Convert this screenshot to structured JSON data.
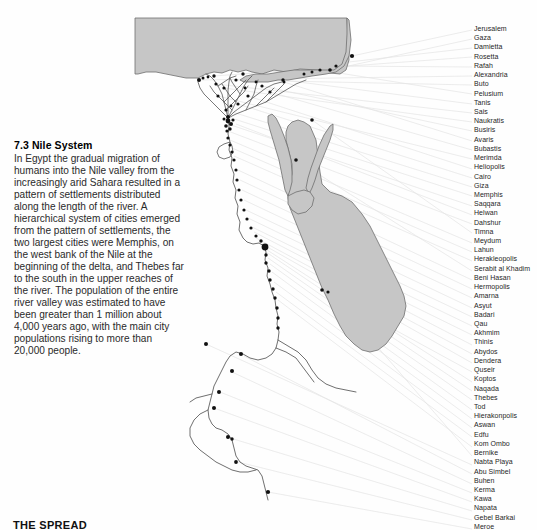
{
  "page": {
    "background": "#fefefe",
    "width": 537,
    "height": 530
  },
  "caption": {
    "title": "7.3 Nile System",
    "body": "In Egypt the gradual migration of humans into the Nile valley from the increasingly arid Sahara resulted in a pattern of settlements distributed along the length of the river. A hierarchical system of cities emerged from the pattern of settlements, the two largest cities were Memphis, on the west bank of the Nile at the beginning of the delta, and Thebes far to the south in the upper reaches of the river. The population of the entire river valley was estimated to have been greater than 1 million about 4,000 years ago, with the main city populations rising to more than 20,000 people."
  },
  "footer": {
    "title": "THE SPREAD"
  },
  "map": {
    "sea_fill": "#c6c6c6",
    "sea_stroke": "#6e6e6e",
    "river_stroke": "#555555",
    "site_dot_color": "#111111",
    "leader_line_color": "#e2e2e2",
    "water_bodies": [
      "Mediterranean Sea",
      "Red Sea",
      "Gulf of Suez",
      "Gulf of Aqaba"
    ]
  },
  "city_labels": [
    "Jerusalem",
    "Gaza",
    "Damietta",
    "Rosetta",
    "Rafah",
    "Alexandria",
    "Buto",
    "Pelusium",
    "Tanis",
    "Sais",
    "Naukratis",
    "Busiris",
    "Avaris",
    "Bubastis",
    "Merimda",
    "Heliopolis",
    "Cairo",
    "Giza",
    "Memphis",
    "Saqqara",
    "Helwan",
    "Dahshur",
    "Timna",
    "Meydum",
    "Lahun",
    "Herakleopolis",
    "Serabit al Khadim",
    "Beni Hasan",
    "Hermopolis",
    "Amarna",
    "Asyut",
    "Badari",
    "Qau",
    "Akhmim",
    "Thinis",
    "Abydos",
    "Dendera",
    "Quseir",
    "Koptos",
    "Naqada",
    "Thebes",
    "Tod",
    "Hierakonpolis",
    "Aswan",
    "Edfu",
    "Kom Ombo",
    "Bernike",
    "Nabta Playa",
    "Abu Simbel",
    "Buhen",
    "Kerma",
    "Kawa",
    "Napata",
    "Gebel Barkai",
    "Meroe"
  ]
}
